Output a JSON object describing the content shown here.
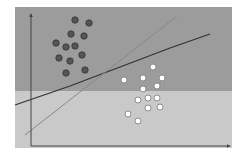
{
  "diagram": {
    "type": "svm-linear-separation",
    "colors": {
      "page_bg": "#ffffff",
      "upper_region": "#9c9c9c",
      "lower_region": "#c9c9c9",
      "dark_point_fill": "#555555",
      "dark_point_stroke": "#333333",
      "light_point_fill": "#ffffff",
      "light_point_stroke": "#777777",
      "axis": "#444444",
      "boundary_dark": "#333333",
      "boundary_light": "#888888"
    },
    "plot_area": {
      "x": 15,
      "y": 7,
      "w": 217,
      "h": 141,
      "split_y": 91
    },
    "axes": {
      "y_axis": {
        "x": 31,
        "y1": 146,
        "y2": 13
      },
      "x_axis": {
        "y": 146,
        "x1": 31,
        "x2": 231
      }
    },
    "lines": [
      {
        "name": "separating-line-dark",
        "points": [
          [
            15,
            105
          ],
          [
            70,
            86
          ],
          [
            120,
            67
          ],
          [
            170,
            48
          ],
          [
            210,
            34
          ]
        ]
      },
      {
        "name": "separating-line-light",
        "points": [
          [
            25,
            135
          ],
          [
            177,
            16
          ]
        ]
      }
    ],
    "class_a_points": [
      [
        75,
        20
      ],
      [
        89,
        23
      ],
      [
        71,
        34
      ],
      [
        84,
        36
      ],
      [
        56,
        43
      ],
      [
        66,
        47
      ],
      [
        75,
        46
      ],
      [
        59,
        58
      ],
      [
        70,
        61
      ],
      [
        82,
        55
      ],
      [
        66,
        73
      ],
      [
        85,
        70
      ]
    ],
    "class_b_points": [
      [
        153,
        67
      ],
      [
        124,
        80
      ],
      [
        143,
        78
      ],
      [
        162,
        78
      ],
      [
        143,
        89
      ],
      [
        157,
        86
      ],
      [
        138,
        100
      ],
      [
        148,
        98
      ],
      [
        157,
        98
      ],
      [
        148,
        108
      ],
      [
        160,
        107
      ],
      [
        128,
        114
      ],
      [
        138,
        121
      ]
    ]
  }
}
